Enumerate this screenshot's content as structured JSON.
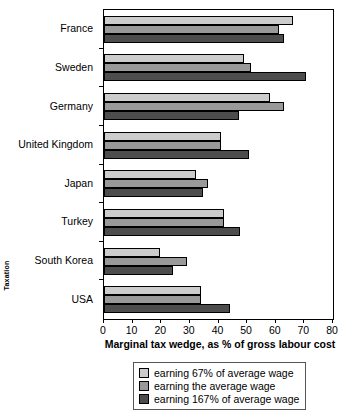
{
  "chart_data": {
    "type": "bar",
    "orientation": "horizontal",
    "title": "",
    "xlabel": "Marginal tax wedge, as % of gross labour cost",
    "ylabel": "Taxation",
    "xlim": [
      0,
      80
    ],
    "xticks": [
      0,
      10,
      20,
      30,
      40,
      50,
      60,
      70,
      80
    ],
    "grid": false,
    "legend_position": "below-center",
    "categories": [
      "France",
      "Sweden",
      "Germany",
      "United Kingdom",
      "Japan",
      "Turkey",
      "South Korea",
      "USA"
    ],
    "series": [
      {
        "name": "earning 67% of average wage",
        "color": "#cccccc",
        "values": [
          66,
          49,
          58,
          41,
          32,
          42,
          19.5,
          34
        ]
      },
      {
        "name": "earning the average wage",
        "color": "#999999",
        "values": [
          61,
          51.5,
          63,
          41,
          36.5,
          42,
          29,
          34
        ]
      },
      {
        "name": "earning 167% of average wage",
        "color": "#4d4d4d",
        "values": [
          63,
          70.5,
          47,
          50.5,
          34.5,
          47.5,
          24,
          44
        ]
      }
    ]
  },
  "axis": {
    "y_title": "Taxation",
    "x_title": "Marginal tax wedge, as % of gross labour cost",
    "x_tick_labels": [
      "0",
      "10",
      "20",
      "30",
      "40",
      "50",
      "60",
      "70",
      "80"
    ],
    "category_labels": [
      "France",
      "Sweden",
      "Germany",
      "United Kingdom",
      "Japan",
      "Turkey",
      "South Korea",
      "USA"
    ]
  },
  "legend": {
    "items": [
      {
        "label": "earning 67% of average wage",
        "color": "#cccccc"
      },
      {
        "label": "earning the average wage",
        "color": "#999999"
      },
      {
        "label": "earning 167% of average wage",
        "color": "#4d4d4d"
      }
    ]
  }
}
